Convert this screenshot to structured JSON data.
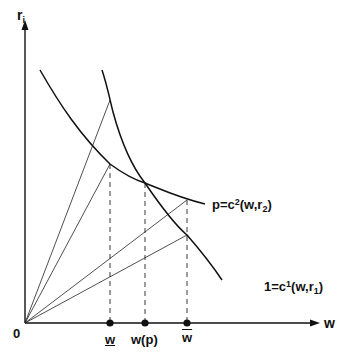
{
  "diagram": {
    "y_axis": {
      "label_main": "r",
      "label_sub": "i"
    },
    "x_axis": {
      "label": "w"
    },
    "origin_label": "0",
    "curves": [
      {
        "name": "output-price-curve",
        "label_pre": "p=c",
        "label_sup": "2",
        "label_mid": "(w,r",
        "label_sub": "2",
        "label_post": ")"
      },
      {
        "name": "unit-cost-curve",
        "label_pre": "1=c",
        "label_sup": "1",
        "label_mid": "(w,r",
        "label_sub": "1",
        "label_post": ")"
      }
    ],
    "ticks": [
      {
        "label": "w",
        "decoration": "underline"
      },
      {
        "label": "w(p)",
        "decoration": "none"
      },
      {
        "label": "w",
        "decoration": "overline"
      }
    ],
    "colors": {
      "line": "#111111",
      "background": "#ffffff"
    }
  }
}
